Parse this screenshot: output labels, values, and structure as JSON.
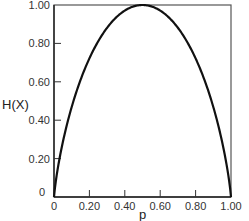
{
  "chart_data": {
    "type": "line",
    "title": "",
    "xlabel": "p",
    "ylabel": "H(X)",
    "xlim": [
      0,
      1
    ],
    "ylim": [
      0,
      1
    ],
    "grid": false,
    "legend": "none",
    "x_ticks": [
      0,
      0.2,
      0.4,
      0.6,
      0.8,
      1.0
    ],
    "x_tick_labels": [
      "0",
      "0.20",
      "0.40",
      "0.60",
      "0.80",
      "1.00"
    ],
    "y_ticks": [
      0,
      0.2,
      0.4,
      0.6,
      0.8,
      1.0
    ],
    "y_tick_labels": [
      "0",
      "0.20",
      "0.40",
      "0.60",
      "0.80",
      "1.00"
    ],
    "series": [
      {
        "name": "Binary entropy H(X) = -p log2 p - (1-p) log2 (1-p)",
        "x": [
          0,
          0.02,
          0.05,
          0.1,
          0.15,
          0.2,
          0.25,
          0.3,
          0.35,
          0.4,
          0.45,
          0.5,
          0.55,
          0.6,
          0.65,
          0.7,
          0.75,
          0.8,
          0.85,
          0.9,
          0.95,
          0.98,
          1.0
        ],
        "y": [
          0,
          0.141,
          0.286,
          0.469,
          0.61,
          0.722,
          0.811,
          0.881,
          0.934,
          0.971,
          0.993,
          1.0,
          0.993,
          0.971,
          0.934,
          0.881,
          0.811,
          0.722,
          0.61,
          0.469,
          0.286,
          0.141,
          0
        ]
      }
    ]
  }
}
